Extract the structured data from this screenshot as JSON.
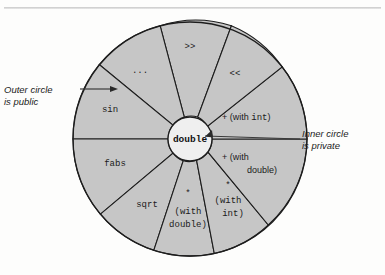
{
  "figure": {
    "title": "",
    "background_color": "#fdfdfc",
    "sector_fill": "#c6c6c6",
    "inner_fill": "#efefef",
    "stroke_color": "#1d1d1d"
  },
  "center": {
    "label": "double"
  },
  "callouts": {
    "outer": "Outer circle\nis public",
    "inner": "Inner circle\nis private"
  },
  "sectors": [
    {
      "id": "shift-right",
      "label": ">>",
      "lines": [
        ">>"
      ],
      "style": "mono"
    },
    {
      "id": "ellipsis",
      "label": "...",
      "lines": [
        "..."
      ],
      "style": "mono"
    },
    {
      "id": "sin",
      "label": "sin",
      "lines": [
        "sin"
      ],
      "style": "mono"
    },
    {
      "id": "fabs",
      "label": "fabs",
      "lines": [
        "fabs"
      ],
      "style": "mono"
    },
    {
      "id": "sqrt",
      "label": "sqrt",
      "lines": [
        "sqrt"
      ],
      "style": "mono"
    },
    {
      "id": "mul-double",
      "label": "* (with double)",
      "lines": [
        "*",
        "(with",
        "double)"
      ],
      "style": "mono"
    },
    {
      "id": "mul-int",
      "label": "* (with int)",
      "lines": [
        "*",
        "(with",
        "int)"
      ],
      "style": "mono"
    },
    {
      "id": "add-double",
      "label": "+ (with double)",
      "lines": [
        "+ (with",
        "double)"
      ],
      "style": "mixed"
    },
    {
      "id": "add-int",
      "label": "+ (with int)",
      "lines": [
        "+ (with int)"
      ],
      "style": "mixed"
    },
    {
      "id": "shift-left",
      "label": "<<",
      "lines": [
        "<<"
      ],
      "style": "mono"
    }
  ],
  "text": {
    "seg_shift_right": ">>",
    "seg_ellipsis": "...",
    "seg_sin": "sin",
    "seg_fabs": "fabs",
    "seg_sqrt": "sqrt",
    "seg_mul_double_l1": "*",
    "seg_mul_double_l2": "(with",
    "seg_mul_double_l3": "double)",
    "seg_mul_int_l1": "*",
    "seg_mul_int_l2": "(with",
    "seg_mul_int_l3": "int)",
    "seg_add_double_l1p": "+ (with",
    "seg_add_double_l2": "double)",
    "seg_add_int_plus": "+ (with ",
    "seg_add_int_type": "int",
    "seg_add_int_close": ")",
    "seg_shift_left": "<<"
  }
}
